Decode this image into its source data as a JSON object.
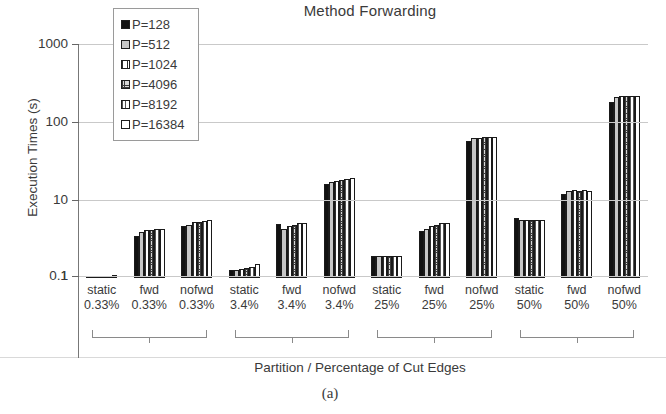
{
  "chart_data": {
    "type": "bar",
    "title": "Method Forwarding",
    "xlabel": "Partition / Percentage of Cut Edges",
    "ylabel": "Execution Times (s)",
    "caption": "(a)",
    "yscale": "log",
    "ylim": [
      0.1,
      1000
    ],
    "ytick_labels": [
      "1000",
      "100",
      "10",
      "1",
      "0.1"
    ],
    "ytick_values": [
      1000,
      100,
      10,
      1,
      0.1
    ],
    "grid": true,
    "legend_position": "top-left-inside",
    "categories": [
      {
        "partition": "static",
        "percent": "0.33%"
      },
      {
        "partition": "fwd",
        "percent": "0.33%"
      },
      {
        "partition": "nofwd",
        "percent": "0.33%"
      },
      {
        "partition": "static",
        "percent": "3.4%"
      },
      {
        "partition": "fwd",
        "percent": "3.4%"
      },
      {
        "partition": "nofwd",
        "percent": "3.4%"
      },
      {
        "partition": "static",
        "percent": "25%"
      },
      {
        "partition": "fwd",
        "percent": "25%"
      },
      {
        "partition": "nofwd",
        "percent": "25%"
      },
      {
        "partition": "static",
        "percent": "50%"
      },
      {
        "partition": "fwd",
        "percent": "50%"
      },
      {
        "partition": "nofwd",
        "percent": "50%"
      }
    ],
    "group_brackets": [
      "0.33%",
      "3.4%",
      "25%",
      "50%"
    ],
    "series": [
      {
        "name": "P=128",
        "pattern": "solid",
        "values": [
          1.0,
          3.5,
          4.7,
          1.25,
          4.9,
          16.0,
          1.9,
          4.0,
          57.0,
          5.8,
          12.0,
          180.0
        ]
      },
      {
        "name": "P=512",
        "pattern": "dots",
        "values": [
          1.0,
          3.9,
          4.8,
          1.25,
          4.2,
          17.0,
          1.9,
          4.3,
          62.0,
          5.6,
          13.0,
          210.0
        ]
      },
      {
        "name": "P=1024",
        "pattern": "vline",
        "values": [
          1.0,
          4.1,
          5.2,
          1.3,
          4.6,
          17.5,
          1.9,
          4.6,
          63.0,
          5.6,
          13.5,
          215.0
        ]
      },
      {
        "name": "P=4096",
        "pattern": "cross",
        "values": [
          1.0,
          4.1,
          5.3,
          1.35,
          4.8,
          18.0,
          1.9,
          4.8,
          64.0,
          5.6,
          13.0,
          215.0
        ]
      },
      {
        "name": "P=8192",
        "pattern": "vline2",
        "values": [
          1.05,
          4.2,
          5.4,
          1.4,
          5.0,
          18.5,
          1.9,
          5.0,
          65.0,
          5.5,
          13.5,
          215.0
        ]
      },
      {
        "name": "P=16384",
        "pattern": "white",
        "values": [
          1.1,
          4.2,
          5.5,
          1.5,
          5.1,
          19.0,
          1.9,
          5.1,
          65.0,
          5.5,
          13.0,
          215.0
        ]
      }
    ]
  }
}
